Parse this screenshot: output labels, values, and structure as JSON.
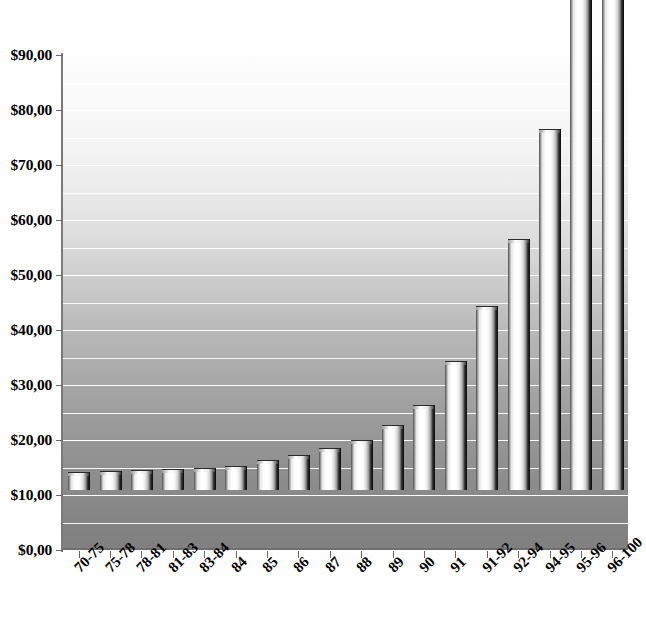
{
  "chart_data": {
    "type": "bar",
    "title": "",
    "subtitle": "",
    "xlabel": "",
    "ylabel": "",
    "categories": [
      "70-75",
      "75-78",
      "78-81",
      "81-83",
      "83-84",
      "84",
      "85",
      "86",
      "87",
      "88",
      "89",
      "90",
      "91",
      "91-92",
      "92-94",
      "94-95",
      "95-96",
      "96-100"
    ],
    "values": [
      3.1,
      3.2,
      3.4,
      3.6,
      3.9,
      4.1,
      5.3,
      6.2,
      7.4,
      9.0,
      11.7,
      15.2,
      23.2,
      33.3,
      45.4,
      65.4,
      90.0,
      101.0
    ],
    "value_labels": [
      "$3,10",
      "$3,20",
      "$3,40",
      "$3,60",
      "$3,90",
      "$4,10",
      "$5,30",
      "$6,20",
      "$7,40",
      "$9,00",
      "$11,70",
      "$15,20",
      "$23,20",
      "$33,30",
      "$45,40",
      "$65,40",
      "$90,00",
      "$101,00"
    ],
    "ylim": [
      0,
      90
    ],
    "y_ticks": [
      0,
      10,
      20,
      30,
      40,
      50,
      60,
      70,
      80,
      90
    ],
    "y_tick_labels": [
      "$0,00",
      "$10,00",
      "$20,00",
      "$30,00",
      "$40,00",
      "$50,00",
      "$60,00",
      "$70,00",
      "$80,00",
      "$90,00"
    ],
    "gridline_interval": 5,
    "grid": true,
    "grid_color": "#ffffff",
    "legend": null,
    "legend_position": "none",
    "bar_style": "3d-cylinder",
    "bar_fill": "#ffffff",
    "bar_edge": "#141414",
    "plot_background": "gradient-white-to-gray",
    "plot_background_top": "#fdfdfd",
    "plot_background_bottom": "#7f7f7f"
  }
}
